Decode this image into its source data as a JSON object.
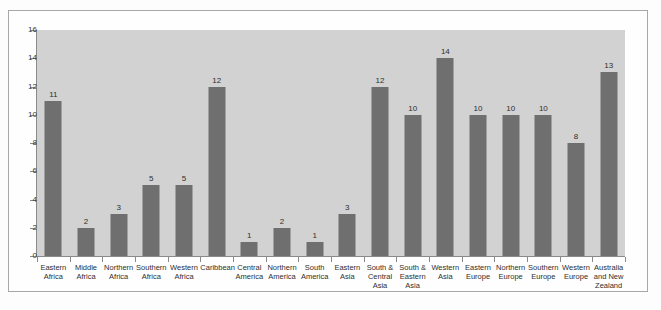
{
  "chart_data": {
    "type": "bar",
    "title": "",
    "subtitle": "",
    "xlabel": "",
    "ylabel": "",
    "ylim": [
      0,
      16
    ],
    "yticks": [
      0,
      2,
      4,
      6,
      8,
      10,
      12,
      14,
      16
    ],
    "grid": false,
    "legend": null,
    "bar_color": "#6f6f6f",
    "plot_background": "#d2d2d2",
    "axis_color": "#8a8a8a",
    "categories": [
      "Eastern\nAfrica",
      "Middle\nAfrica",
      "Northern\nAfrica",
      "Southern\nAfrica",
      "Western\nAfrica",
      "Caribbean",
      "Central\nAmerica",
      "Northern\nAmerica",
      "South\nAmerica",
      "Eastern\nAsia",
      "South &\nCentral\nAsia",
      "South &\nEastern\nAsia",
      "Western\nAsia",
      "Eastern\nEurope",
      "Northern\nEurope",
      "Southern\nEurope",
      "Western\nEurope",
      "Australia\nand New\nZealand"
    ],
    "values": [
      11,
      2,
      3,
      5,
      5,
      12,
      1,
      2,
      1,
      3,
      12,
      10,
      14,
      10,
      10,
      10,
      8,
      13
    ],
    "value_labels": [
      "11",
      "2",
      "3",
      "5",
      "5",
      "12",
      "1",
      "2",
      "1",
      "3",
      "12",
      "10",
      "14",
      "10",
      "10",
      "10",
      "8",
      "13"
    ],
    "ytick_labels": [
      "0",
      "2",
      "4",
      "6",
      "8",
      "10",
      "12",
      "14",
      "16"
    ]
  }
}
